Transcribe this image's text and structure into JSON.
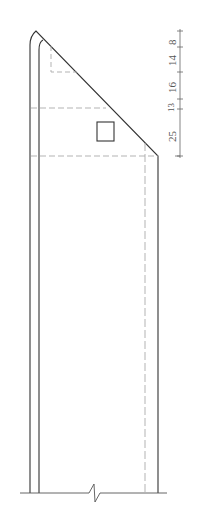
{
  "drawing": {
    "type": "structural-section-elevation",
    "colors": {
      "line": "#333333",
      "dashed": "#aaaaaa",
      "dim": "#666666",
      "background": "#ffffff"
    },
    "dimensions": [
      {
        "label": "8",
        "y_from": 31,
        "y_to": 47
      },
      {
        "label": "14",
        "y_from": 47,
        "y_to": 72
      },
      {
        "label": "16",
        "y_from": 72,
        "y_to": 99
      },
      {
        "label": "13",
        "y_from": 99,
        "y_to": 109
      },
      {
        "label": "25",
        "y_from": 109,
        "y_to": 156
      }
    ],
    "break_symbol": "z-break"
  }
}
